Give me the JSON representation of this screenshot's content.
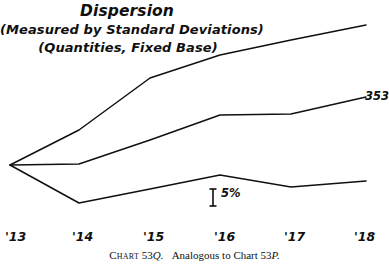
{
  "figure": {
    "width": 389,
    "height": 269,
    "background": "#ffffff",
    "ink_color": "#101010"
  },
  "title": {
    "main": "Dispersion",
    "sub1": "(Measured by Standard Deviations)",
    "sub2": "(Quantities, Fixed Base)"
  },
  "caption": {
    "chart_label": "Chart 53Q.",
    "text": "Analogous to Chart 53P.",
    "chart_word": "Chart",
    "chart_number": "53",
    "chart_letter": "Q.",
    "ref_prefix": "Analogous to Chart 53",
    "ref_letter": "P."
  },
  "scale_marker": {
    "label": "5%",
    "name": "scale-bar-5-percent"
  },
  "series_end_label": {
    "value": "353"
  },
  "xticks": [
    {
      "label": "'13",
      "x": 10
    },
    {
      "label": "'14",
      "x": 79
    },
    {
      "label": "'15",
      "x": 150
    },
    {
      "label": "'16",
      "x": 220
    },
    {
      "label": "'17",
      "x": 291
    },
    {
      "label": "'18",
      "x": 362
    }
  ],
  "chart_data": {
    "type": "line",
    "title": "Dispersion (Measured by Standard Deviations) (Quantities, Fixed Base)",
    "subtitle": "(Quantities, Fixed Base)",
    "xlabel": "",
    "ylabel": "",
    "x": [
      "'13",
      "'14",
      "'15",
      "'16",
      "'17",
      "'18"
    ],
    "grid": false,
    "legend": "none",
    "axis_note": "Vertical scale indicated only by a 5% reference bar; no numeric y-axis ticks are printed.",
    "scale_bar_percent": 5,
    "series": [
      {
        "name": "upper",
        "end_label": "",
        "values_px": [
          165,
          130,
          78,
          55,
          40,
          25
        ],
        "values_pct": [
          0,
          5.0,
          12.4,
          15.7,
          17.9,
          20.0
        ],
        "description": "Upper dispersion curve rising steadily from the common 1913 base to the highest 1918 value."
      },
      {
        "name": "middle",
        "end_label": "353",
        "values_px": [
          165,
          164,
          140,
          115,
          114,
          97
        ],
        "values_pct": [
          0,
          0.1,
          3.6,
          7.1,
          7.3,
          9.7
        ],
        "description": "Middle dispersion curve, labeled 353 at its 1918 terminus; flat from 1916 to 1917."
      },
      {
        "name": "lower",
        "end_label": "",
        "values_px": [
          165,
          203,
          189,
          175,
          187,
          181
        ],
        "values_pct": [
          0,
          -5.4,
          -3.4,
          -1.4,
          -3.1,
          -2.3
        ],
        "description": "Lower dispersion curve dipping below the base in 1914, peaking in 1916, then easing."
      }
    ],
    "origin_note": "All three series originate from a single common point at '13."
  }
}
